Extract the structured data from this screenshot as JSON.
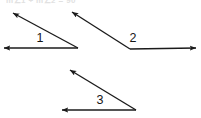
{
  "figure": {
    "title_fragment": "m∠1 + m∠2 = 90",
    "background_color": "#ffffff",
    "stroke_color": "#1b1b1b",
    "label_color": "#161616",
    "width": 201,
    "height": 118,
    "angles": [
      {
        "label": "1",
        "label_x": 40,
        "label_y": 42,
        "vertex_x": 78,
        "vertex_y": 48,
        "rays": [
          {
            "name": "upper-left-ray",
            "tip_x": 13,
            "tip_y": 13
          },
          {
            "name": "horizontal-left-ray",
            "tip_x": 4,
            "tip_y": 48
          }
        ]
      },
      {
        "label": "2",
        "label_x": 133,
        "label_y": 42,
        "vertex_x": 130,
        "vertex_y": 49,
        "rays": [
          {
            "name": "upper-left-ray",
            "tip_x": 72,
            "tip_y": 12
          },
          {
            "name": "horizontal-right-ray",
            "tip_x": 196,
            "tip_y": 48
          }
        ]
      },
      {
        "label": "3",
        "label_x": 100,
        "label_y": 104,
        "vertex_x": 136,
        "vertex_y": 110,
        "rays": [
          {
            "name": "upper-left-ray",
            "tip_x": 70,
            "tip_y": 70
          },
          {
            "name": "horizontal-left-ray",
            "tip_x": 62,
            "tip_y": 110
          }
        ]
      }
    ]
  }
}
